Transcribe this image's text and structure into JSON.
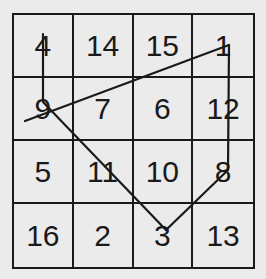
{
  "magic_square": {
    "rows": [
      [
        "4",
        "14",
        "15",
        "1"
      ],
      [
        "9",
        "7",
        "6",
        "12"
      ],
      [
        "5",
        "11",
        "10",
        "8"
      ],
      [
        "16",
        "2",
        "3",
        "13"
      ]
    ]
  },
  "path": {
    "stroke_color": "#1a1a1a",
    "segments": [
      {
        "from_label": "4",
        "to_label": "9",
        "points": "43,34 43,100"
      },
      {
        "from_label": "tail",
        "to_label": "1",
        "points": "25,121 229,45"
      },
      {
        "from_label": "1",
        "to_label": "8",
        "points": "229,45 228,170"
      },
      {
        "from_label": "9",
        "to_label": "3",
        "points": "43,102 166,230"
      },
      {
        "from_label": "3",
        "to_label": "8",
        "points": "166,230 228,170"
      }
    ]
  }
}
